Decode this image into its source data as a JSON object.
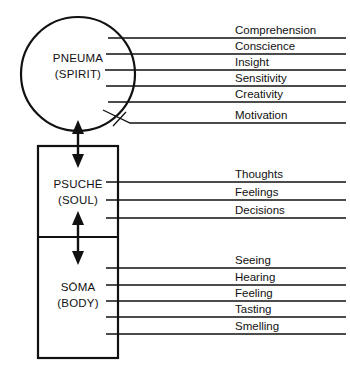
{
  "diagram": {
    "colors": {
      "stroke": "#111111",
      "background": "#ffffff"
    },
    "parts": [
      {
        "id": "spirit",
        "greek": "PNEUMA",
        "english": "(SPIRIT)",
        "shape": "circle",
        "functions": [
          "Comprehension",
          "Conscience",
          "Insight",
          "Sensitivity",
          "Creativity",
          "Motivation"
        ]
      },
      {
        "id": "soul",
        "greek": "PSUCHĒ",
        "english": "(SOUL)",
        "shape": "rectangle-upper",
        "functions": [
          "Thoughts",
          "Feelings",
          "Decisions"
        ]
      },
      {
        "id": "body",
        "greek": "SŌMA",
        "english": "(BODY)",
        "shape": "rectangle-lower",
        "functions": [
          "Seeing",
          "Hearing",
          "Feeling",
          "Tasting",
          "Smelling"
        ]
      }
    ],
    "connectors": [
      {
        "id": "spirit-soul-arrow",
        "type": "double-headed-vertical-arrow"
      },
      {
        "id": "soul-body-arrow",
        "type": "double-headed-vertical-arrow"
      }
    ]
  }
}
